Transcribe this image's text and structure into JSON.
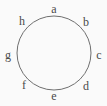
{
  "figure": {
    "type": "circle-with-labeled-points",
    "background_color": "#fafafa",
    "width": 107,
    "height": 106
  },
  "circle": {
    "center_x": 54,
    "center_y": 53,
    "radius": 37,
    "stroke_color": "#6f6f6f",
    "stroke_width": 1,
    "fill": "none"
  },
  "labels": [
    {
      "text": "a",
      "position": "top",
      "x": 54,
      "y": 9,
      "angle_deg": 90
    },
    {
      "text": "b",
      "position": "upper-right",
      "x": 86,
      "y": 22,
      "angle_deg": 45
    },
    {
      "text": "c",
      "position": "right",
      "x": 99,
      "y": 55,
      "angle_deg": 0
    },
    {
      "text": "d",
      "position": "lower-right",
      "x": 86,
      "y": 86,
      "angle_deg": -45
    },
    {
      "text": "e",
      "position": "bottom",
      "x": 54,
      "y": 96,
      "angle_deg": -90
    },
    {
      "text": "f",
      "position": "lower-left",
      "x": 24,
      "y": 85,
      "angle_deg": -135
    },
    {
      "text": "g",
      "position": "left",
      "x": 8,
      "y": 55,
      "angle_deg": 180
    },
    {
      "text": "h",
      "position": "upper-left",
      "x": 22,
      "y": 21,
      "angle_deg": 135
    }
  ]
}
